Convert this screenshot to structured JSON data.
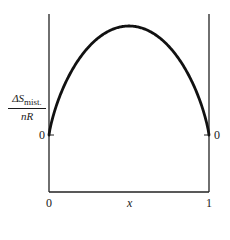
{
  "chart_data": {
    "type": "line",
    "title": "",
    "xlabel": "x",
    "ylabel": "ΔS_mist. / nR",
    "ylabel_parts": {
      "numerator_main": "ΔS",
      "numerator_sub": "mist.",
      "denominator": "nR"
    },
    "x_ticks": [
      "0",
      "1"
    ],
    "y_ticks_left": [
      "0"
    ],
    "y_ticks_right": [
      "0"
    ],
    "xlim": [
      0,
      1
    ],
    "grid": false,
    "legend": null,
    "series": [
      {
        "name": "ΔS_mist./nR",
        "x": [
          0,
          0.05,
          0.1,
          0.2,
          0.3,
          0.4,
          0.5,
          0.6,
          0.7,
          0.8,
          0.9,
          0.95,
          1
        ],
        "values": [
          0,
          0.199,
          0.325,
          0.5,
          0.611,
          0.673,
          0.693,
          0.673,
          0.611,
          0.5,
          0.325,
          0.199,
          0
        ]
      }
    ]
  },
  "labels": {
    "x_axis": "x",
    "x_tick_0": "0",
    "x_tick_1": "1",
    "y_zero_left": "0",
    "y_zero_right": "0",
    "y_num_main": "ΔS",
    "y_num_sub": "mist.",
    "y_den": "nR"
  }
}
